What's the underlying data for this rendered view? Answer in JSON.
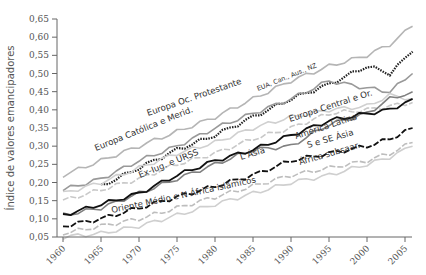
{
  "chart_data": {
    "type": "line",
    "title": "",
    "xlabel": "",
    "ylabel": "Índice de valores emancipadores",
    "xlim": [
      1960,
      2007
    ],
    "ylim": [
      0.05,
      0.65
    ],
    "x_ticks": [
      "1960",
      "1965",
      "1970",
      "1975",
      "1980",
      "1985",
      "1990",
      "1995",
      "2000",
      "2005"
    ],
    "y_ticks": [
      "0,05",
      "0,10",
      "0,15",
      "0,20",
      "0,25",
      "0,30",
      "0,35",
      "0,40",
      "0,45",
      "0,50",
      "0,55",
      "0,60",
      "0,65"
    ],
    "grid": false,
    "legend": "inline-labels",
    "x": [
      1960,
      1965,
      1970,
      1975,
      1980,
      1985,
      1990,
      1995,
      2000,
      2003,
      2006
    ],
    "series": [
      {
        "name": "Europa Oc. Protestante",
        "color": "#b5b5b5",
        "dash": "solid",
        "values": [
          0.22,
          0.26,
          0.3,
          0.34,
          0.38,
          0.43,
          0.48,
          0.52,
          0.55,
          0.58,
          0.63
        ]
      },
      {
        "name": "EUA, Can., Aus., NZ",
        "color": "#222222",
        "dash": "dotted",
        "values": [
          null,
          0.19,
          0.24,
          0.29,
          0.33,
          0.38,
          0.43,
          0.47,
          0.52,
          0.5,
          0.56
        ]
      },
      {
        "name": "Europa Católica e Merid.",
        "color": "#999999",
        "dash": "solid",
        "values": [
          0.18,
          0.21,
          0.26,
          0.3,
          0.35,
          0.39,
          0.43,
          0.48,
          0.46,
          0.45,
          0.5
        ]
      },
      {
        "name": "Ex-Iug. e URSS",
        "color": "#c8c8c8",
        "dash": "dashed",
        "values": [
          0.15,
          0.18,
          0.21,
          0.25,
          0.28,
          0.32,
          0.35,
          0.39,
          0.4,
          0.41,
          0.42
        ]
      },
      {
        "name": "Europa Central e Or.",
        "color": "#d0d0d0",
        "dash": "solid",
        "values": [
          0.17,
          0.2,
          0.24,
          0.28,
          0.31,
          0.35,
          0.38,
          0.4,
          0.41,
          0.44,
          0.43
        ]
      },
      {
        "name": "América Latina",
        "color": "#808080",
        "dash": "solid",
        "values": [
          0.11,
          0.13,
          0.17,
          0.21,
          0.25,
          0.29,
          0.3,
          0.36,
          0.39,
          0.43,
          0.45
        ]
      },
      {
        "name": "L Ásia",
        "color": "#111111",
        "dash": "solid",
        "values": [
          0.11,
          0.14,
          0.17,
          0.22,
          0.26,
          0.29,
          0.33,
          0.37,
          0.39,
          0.4,
          0.43
        ]
      },
      {
        "name": "S e SE Ásia",
        "color": "#111111",
        "dash": "dashed",
        "values": [
          0.08,
          0.1,
          0.13,
          0.16,
          0.19,
          0.22,
          0.26,
          0.28,
          0.3,
          0.32,
          0.35
        ]
      },
      {
        "name": "África subsaar.",
        "color": "#bdbdbd",
        "dash": "dashed",
        "values": [
          0.06,
          0.08,
          0.1,
          0.13,
          0.16,
          0.19,
          0.22,
          0.24,
          0.26,
          0.28,
          0.31
        ]
      },
      {
        "name": "Oriente Médio e N África islâmicos",
        "color": "#cfcfcf",
        "dash": "solid",
        "values": [
          0.05,
          0.06,
          0.08,
          0.11,
          0.14,
          0.17,
          0.2,
          0.22,
          0.25,
          0.27,
          0.3
        ]
      }
    ],
    "annotations": [
      {
        "text": "Europa Oc. Protestante",
        "series": 0
      },
      {
        "text": "EUA, Can., Aus., NZ",
        "series": 1
      },
      {
        "text": "Europa Católica e Merid.",
        "series": 2
      },
      {
        "text": "Ex-Iug. e URSS",
        "series": 3
      },
      {
        "text": "Europa Central e Or.",
        "series": 4
      },
      {
        "text": "América Latina",
        "series": 5
      },
      {
        "text": "L Ásia",
        "series": 6
      },
      {
        "text": "S e SE Ásia",
        "series": 7
      },
      {
        "text": "África subsaar.",
        "series": 8
      },
      {
        "text": "Oriente Médio e N África islâmicos",
        "series": 9
      }
    ]
  }
}
